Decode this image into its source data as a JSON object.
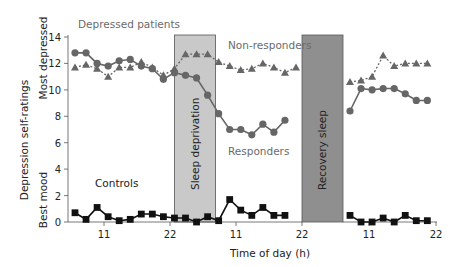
{
  "chart_data": {
    "type": "line",
    "title": "Depressed patients",
    "xlabel": "Time of day (h)",
    "ylabel": "Depression self-ratings",
    "ylabel_top": "Most depressed",
    "ylabel_bottom": "Best mood",
    "ylim": [
      0,
      14
    ],
    "yticks": [
      0,
      2,
      4,
      6,
      8,
      10,
      12,
      14
    ],
    "xtick_labels": [
      "11",
      "22",
      "11",
      "22",
      "11",
      "22"
    ],
    "grid": false,
    "shaded_regions": [
      {
        "label": "Sleep deprivation",
        "color": "#c8c8c8"
      },
      {
        "label": "Recovery sleep",
        "color": "#8e8e8e"
      }
    ],
    "series": [
      {
        "name": "Non-responders",
        "marker": "triangle",
        "style": "dotted",
        "color": "#666666",
        "segment1": [
          11.7,
          11.9,
          11.6,
          11.0,
          11.7,
          11.7,
          12.1,
          11.7,
          11.1,
          11.6,
          12.7,
          12.7,
          12.7,
          12.1,
          11.8,
          11.5,
          11.6,
          12.0,
          11.7,
          11.3,
          11.7
        ],
        "segment2": [
          10.6,
          10.7,
          11.0,
          12.6,
          11.8,
          12.0,
          12.0,
          12.0
        ]
      },
      {
        "name": "Responders",
        "marker": "circle",
        "style": "solid",
        "color": "#666666",
        "segment1": [
          12.8,
          12.8,
          12.0,
          11.8,
          12.2,
          12.3,
          11.8,
          11.6,
          10.8,
          11.3,
          11.1,
          10.9,
          9.6,
          8.2,
          7.0,
          7.0,
          6.6,
          7.4,
          6.8,
          7.7
        ],
        "segment2": [
          8.4,
          10.1,
          10.0,
          10.1,
          10.1,
          9.7,
          9.2,
          9.2
        ]
      },
      {
        "name": "Controls",
        "marker": "square",
        "style": "solid",
        "color": "#111111",
        "segment1": [
          0.7,
          0.2,
          1.1,
          0.4,
          0.1,
          0.2,
          0.6,
          0.6,
          0.4,
          0.3,
          0.3,
          0.0,
          0.4,
          0.1,
          1.7,
          0.9,
          0.5,
          1.1,
          0.5,
          0.5
        ],
        "segment2": [
          0.5,
          0.0,
          0.0,
          0.3,
          0.0,
          0.5,
          0.1,
          0.1
        ]
      }
    ],
    "annotations": [
      "Depressed patients",
      "Non-responders",
      "Responders",
      "Controls"
    ]
  }
}
